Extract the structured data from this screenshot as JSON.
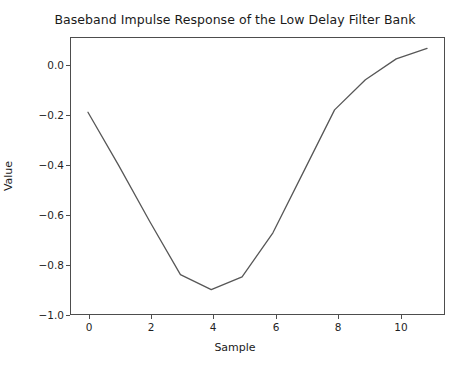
{
  "chart_data": {
    "type": "line",
    "title": "Baseband Impulse Response of the Low Delay Filter Bank",
    "xlabel": "Sample",
    "ylabel": "Value",
    "x": [
      0,
      1,
      2,
      3,
      4,
      5,
      6,
      7,
      8,
      9,
      10,
      11
    ],
    "values": [
      -0.2,
      -0.43,
      -0.67,
      -0.9,
      -0.965,
      -0.91,
      -0.72,
      -0.455,
      -0.19,
      -0.06,
      0.03,
      0.075
    ],
    "series": [
      {
        "name": "impulse response",
        "values": [
          -0.2,
          -0.43,
          -0.67,
          -0.9,
          -0.965,
          -0.91,
          -0.72,
          -0.455,
          -0.19,
          -0.06,
          0.03,
          0.075
        ]
      }
    ],
    "xlim": [
      -0.55,
      11.55
    ],
    "ylim": [
      -1.07,
      0.12
    ],
    "xticks": [
      0,
      2,
      4,
      6,
      8,
      10
    ],
    "xtick_labels": [
      "0",
      "2",
      "4",
      "6",
      "8",
      "10"
    ],
    "yticks": [
      0.0,
      -0.2,
      -0.4,
      -0.6,
      -0.8,
      -1.0
    ],
    "ytick_labels": [
      "0.0",
      "−0.2",
      "−0.4",
      "−0.6",
      "−0.8",
      "−1.0"
    ],
    "grid": false,
    "legend": false,
    "line_color": "#575757",
    "line_width": 1.3,
    "frame_color": "#4d4d4d",
    "background": "#ffffff"
  }
}
